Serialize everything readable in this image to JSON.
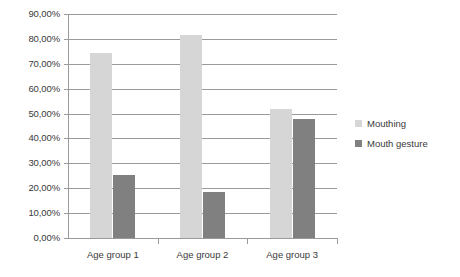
{
  "chart_data": {
    "type": "bar",
    "title": "",
    "xlabel": "",
    "ylabel": "",
    "categories": [
      "Age group 1",
      "Age group 2",
      "Age group 3"
    ],
    "series": [
      {
        "name": "Mouthing",
        "color": "#d6d6d6",
        "values": [
          74.5,
          81.5,
          52.0
        ]
      },
      {
        "name": "Mouth gesture",
        "color": "#808080",
        "values": [
          25.5,
          18.5,
          48.0
        ]
      }
    ],
    "ylim": [
      0,
      90
    ],
    "ytick_values": [
      0,
      10,
      20,
      30,
      40,
      50,
      60,
      70,
      80,
      90
    ],
    "ytick_labels": [
      "0,00%",
      "10,00%",
      "20,00%",
      "30,00%",
      "40,00%",
      "50,00%",
      "60,00%",
      "70,00%",
      "80,00%",
      "90,00%"
    ],
    "grid": true,
    "legend_position": "right",
    "background_color": "#ffffff",
    "axis_color": "#9a9a9a",
    "text_color": "#3a3a3a"
  }
}
